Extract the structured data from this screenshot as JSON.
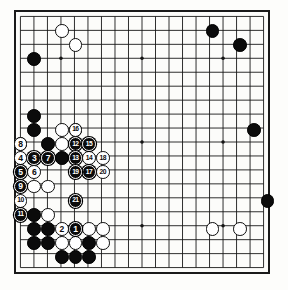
{
  "board": {
    "kind": "go-board",
    "size": 19,
    "line_color": "#141414",
    "board_color": "#fcfcfa",
    "black_color": "#0b0b0b",
    "white_color": "#ffffff",
    "star_points": [
      [
        3,
        3
      ],
      [
        9,
        3
      ],
      [
        15,
        3
      ],
      [
        3,
        9
      ],
      [
        9,
        9
      ],
      [
        15,
        9
      ],
      [
        3,
        15
      ],
      [
        9,
        15
      ],
      [
        15,
        15
      ]
    ]
  },
  "stones": [
    {
      "c": 4,
      "r": 2,
      "color": "white"
    },
    {
      "c": 5,
      "r": 3,
      "color": "white"
    },
    {
      "c": 2,
      "r": 4,
      "color": "black"
    },
    {
      "c": 15,
      "r": 2,
      "color": "black"
    },
    {
      "c": 17,
      "r": 3,
      "color": "black"
    },
    {
      "c": 2,
      "r": 8,
      "color": "black"
    },
    {
      "c": 2,
      "r": 9,
      "color": "black"
    },
    {
      "c": 4,
      "r": 9,
      "color": "white"
    },
    {
      "c": 5,
      "r": 9,
      "color": "white"
    },
    {
      "c": 1,
      "r": 10,
      "color": "white"
    },
    {
      "c": 3,
      "r": 10,
      "color": "black"
    },
    {
      "c": 4,
      "r": 10,
      "color": "white"
    },
    {
      "c": 2,
      "r": 11,
      "color": "white"
    },
    {
      "c": 3,
      "r": 11,
      "color": "black"
    },
    {
      "c": 4,
      "r": 11,
      "color": "black"
    },
    {
      "c": 18,
      "r": 9,
      "color": "black"
    },
    {
      "c": 2,
      "r": 13,
      "color": "white"
    },
    {
      "c": 3,
      "r": 13,
      "color": "white"
    },
    {
      "c": 19,
      "r": 14,
      "color": "black"
    },
    {
      "c": 2,
      "r": 15,
      "color": "black"
    },
    {
      "c": 3,
      "r": 15,
      "color": "white"
    },
    {
      "c": 2,
      "r": 16,
      "color": "black"
    },
    {
      "c": 3,
      "r": 16,
      "color": "black"
    },
    {
      "c": 6,
      "r": 16,
      "color": "white"
    },
    {
      "c": 7,
      "r": 16,
      "color": "white"
    },
    {
      "c": 15,
      "r": 16,
      "color": "white"
    },
    {
      "c": 17,
      "r": 16,
      "color": "white"
    },
    {
      "c": 2,
      "r": 17,
      "color": "black"
    },
    {
      "c": 3,
      "r": 17,
      "color": "black"
    },
    {
      "c": 4,
      "r": 17,
      "color": "white"
    },
    {
      "c": 5,
      "r": 17,
      "color": "white"
    },
    {
      "c": 6,
      "r": 17,
      "color": "black"
    },
    {
      "c": 7,
      "r": 17,
      "color": "white"
    },
    {
      "c": 4,
      "r": 18,
      "color": "black"
    },
    {
      "c": 5,
      "r": 18,
      "color": "black"
    },
    {
      "c": 6,
      "r": 18,
      "color": "black"
    }
  ],
  "numbered_moves": [
    {
      "n": "1",
      "c": 5,
      "r": 16,
      "color": "black"
    },
    {
      "n": "2",
      "c": 4,
      "r": 16,
      "color": "white"
    },
    {
      "n": "3",
      "c": 2,
      "r": 11,
      "color": "black"
    },
    {
      "n": "4",
      "c": 1,
      "r": 11,
      "color": "white"
    },
    {
      "n": "5",
      "c": 1,
      "r": 12,
      "color": "black"
    },
    {
      "n": "6",
      "c": 2,
      "r": 12,
      "color": "white"
    },
    {
      "n": "7",
      "c": 3,
      "r": 11,
      "color": "black"
    },
    {
      "n": "8",
      "c": 1,
      "r": 10,
      "color": "white"
    },
    {
      "n": "9",
      "c": 1,
      "r": 13,
      "color": "black"
    },
    {
      "n": "10",
      "c": 1,
      "r": 14,
      "color": "white"
    },
    {
      "n": "11",
      "c": 1,
      "r": 15,
      "color": "black"
    },
    {
      "n": "12",
      "c": 5,
      "r": 10,
      "color": "black"
    },
    {
      "n": "13",
      "c": 5,
      "r": 11,
      "color": "black"
    },
    {
      "n": "14",
      "c": 6,
      "r": 11,
      "color": "white"
    },
    {
      "n": "15",
      "c": 6,
      "r": 10,
      "color": "black"
    },
    {
      "n": "16",
      "c": 5,
      "r": 9,
      "color": "white"
    },
    {
      "n": "17",
      "c": 6,
      "r": 12,
      "color": "black"
    },
    {
      "n": "18",
      "c": 7,
      "r": 11,
      "color": "white"
    },
    {
      "n": "19",
      "c": 5,
      "r": 12,
      "color": "black"
    },
    {
      "n": "20",
      "c": 7,
      "r": 12,
      "color": "white"
    },
    {
      "n": "21",
      "c": 5,
      "r": 14,
      "color": "black"
    }
  ]
}
